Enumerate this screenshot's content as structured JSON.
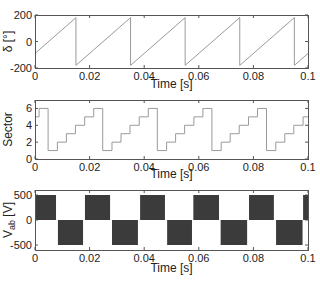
{
  "chart_data": [
    {
      "type": "line",
      "title": "",
      "xlabel": "Time [s]",
      "ylabel": "δ [°]",
      "xlim": [
        0,
        0.1
      ],
      "ylim": [
        -200,
        200
      ],
      "xticks": [
        "0",
        "0.02",
        "0.04",
        "0.06",
        "0.08",
        "0.1"
      ],
      "yticks": [
        "-200",
        "0",
        "200"
      ],
      "grid": false,
      "description": "Sawtooth angle: rises linearly 360° per 0.02 s, wrapping from 180 to -180",
      "series": [
        {
          "name": "delta",
          "x": [
            0,
            0.015,
            0.015,
            0.035,
            0.035,
            0.055,
            0.055,
            0.075,
            0.075,
            0.095,
            0.095,
            0.1
          ],
          "y": [
            -90,
            180,
            -180,
            180,
            -180,
            180,
            -180,
            180,
            -180,
            180,
            -180,
            -90
          ]
        }
      ]
    },
    {
      "type": "line",
      "title": "",
      "xlabel": "Time [s]",
      "ylabel": "Sector",
      "xlim": [
        0,
        0.1
      ],
      "ylim": [
        0,
        7
      ],
      "xticks": [
        "0",
        "0.02",
        "0.04",
        "0.06",
        "0.08",
        "0.1"
      ],
      "yticks": [
        "0",
        "2",
        "4",
        "6"
      ],
      "grid": false,
      "step": true,
      "description": "Stepwise sector index 1..6, each step ~0.00333 s",
      "series": [
        {
          "name": "sector",
          "x": [
            0,
            0.0015,
            0.0048,
            0.0082,
            0.0115,
            0.0148,
            0.0182,
            0.0215,
            0.0248,
            0.0282,
            0.0315,
            0.0348,
            0.0382,
            0.0415,
            0.0448,
            0.0482,
            0.0515,
            0.0548,
            0.0582,
            0.0615,
            0.0648,
            0.0682,
            0.0715,
            0.0748,
            0.0782,
            0.0815,
            0.0848,
            0.0882,
            0.0915,
            0.0948,
            0.0982,
            0.1
          ],
          "y": [
            5,
            6,
            1,
            2,
            3,
            4,
            5,
            6,
            1,
            2,
            3,
            4,
            5,
            6,
            1,
            2,
            3,
            4,
            5,
            6,
            1,
            2,
            3,
            4,
            5,
            6,
            1,
            2,
            3,
            4,
            5,
            5
          ]
        }
      ]
    },
    {
      "type": "area",
      "title": "",
      "xlabel": "Time [s]",
      "ylabel": "V_ab [V]",
      "ylabel_main": "V",
      "ylabel_sub": "ab",
      "ylabel_unit": "[V]",
      "xlim": [
        0,
        0.1
      ],
      "ylim": [
        -600,
        600
      ],
      "xticks": [
        "0",
        "0.02",
        "0.04",
        "0.06",
        "0.08",
        "0.1"
      ],
      "yticks": [
        "-500",
        "0",
        "500"
      ],
      "grid": false,
      "description": "PWM line voltage: dense switching between 0 and ±500 V, envelope alternates each half-period",
      "series": [
        {
          "name": "Vab_positive_blocks",
          "value": 500,
          "intervals": [
            [
              0,
              0.0077
            ],
            [
              0.0183,
              0.0275
            ],
            [
              0.0385,
              0.0476
            ],
            [
              0.058,
              0.0674
            ],
            [
              0.0784,
              0.0875
            ],
            [
              0.0982,
              0.1
            ]
          ]
        },
        {
          "name": "Vab_negative_blocks",
          "value": -500,
          "intervals": [
            [
              0.0084,
              0.0176
            ],
            [
              0.0282,
              0.0377
            ],
            [
              0.0484,
              0.0575
            ],
            [
              0.068,
              0.0777
            ],
            [
              0.0883,
              0.098
            ]
          ]
        }
      ]
    }
  ],
  "colors": {
    "trace": "#9a9a9a",
    "block": "#3b3b3b",
    "frame": "#555555"
  },
  "layout": {
    "plots": [
      {
        "left": 35,
        "top": 15,
        "right": 308,
        "bottom": 68,
        "xlabel_y": 88,
        "ylabel_x": 12
      },
      {
        "left": 35,
        "top": 100,
        "right": 308,
        "bottom": 159,
        "xlabel_y": 178,
        "ylabel_x": 12
      },
      {
        "left": 35,
        "top": 190,
        "right": 308,
        "bottom": 250,
        "xlabel_y": 272,
        "ylabel_x": 12
      }
    ]
  }
}
